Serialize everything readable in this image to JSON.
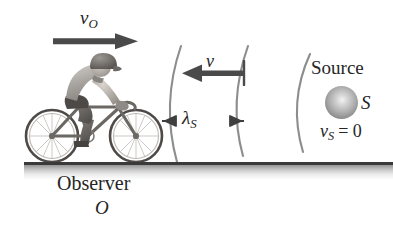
{
  "figure": {
    "background_color": "#ffffff",
    "width": 393,
    "height": 235
  },
  "labels": {
    "observer_velocity": "v",
    "observer_velocity_sub": "O",
    "sound_velocity": "v",
    "wavelength": "λ",
    "wavelength_sub": "S",
    "source_caption": "Source",
    "source_symbol": "S",
    "source_velocity": "v",
    "source_velocity_sub": "S",
    "source_velocity_value": "= 0",
    "observer_caption": "Observer",
    "observer_symbol": "O"
  },
  "elements": {
    "cyclist_alt": "cyclist riding bicycle to the right",
    "sphere_alt": "gray shaded sphere representing the sound source",
    "wavefronts_count": 3,
    "ground_alt": "horizontal ground line with shadow"
  },
  "colors": {
    "ink": "#262626",
    "arrow": "#4a4a4a",
    "arc": "#8a8a8a",
    "ground": "#3a3a3a",
    "sphere_highlight": "#f2f2f2",
    "sphere_edge": "#5e5e5e"
  },
  "physics": {
    "observer_motion": "toward source, speed v_O",
    "source_motion": "stationary, v_S = 0",
    "wave_direction": "leftward, speed v",
    "wavelength_label": "lambda_S measured between adjacent wavefronts"
  }
}
